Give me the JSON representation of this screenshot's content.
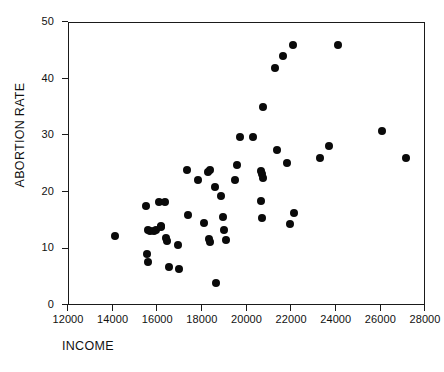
{
  "chart_data": {
    "type": "scatter",
    "title": "",
    "xlabel": "INCOME",
    "ylabel": "ABORTION RATE",
    "xlim": [
      12000,
      28000
    ],
    "ylim": [
      0,
      50
    ],
    "xticks": [
      12000,
      14000,
      16000,
      18000,
      20000,
      22000,
      24000,
      26000,
      28000
    ],
    "yticks": [
      0,
      10,
      20,
      30,
      40,
      50
    ],
    "xtick_labels": [
      "12000",
      "14000",
      "16000",
      "18000",
      "20000",
      "22000",
      "24000",
      "26000",
      "28000"
    ],
    "ytick_labels": [
      "0",
      "10",
      "20",
      "30",
      "40",
      "50"
    ],
    "grid": false,
    "legend": false,
    "marker": "filled-circle",
    "marker_color": "#0a0a0a",
    "marker_size": 8,
    "n_points": 52,
    "points": [
      {
        "x": 14050,
        "y": 12.3
      },
      {
        "x": 15450,
        "y": 17.6
      },
      {
        "x": 15480,
        "y": 9.2
      },
      {
        "x": 15530,
        "y": 7.7
      },
      {
        "x": 15560,
        "y": 13.5
      },
      {
        "x": 15640,
        "y": 13.3
      },
      {
        "x": 15820,
        "y": 13.3
      },
      {
        "x": 15900,
        "y": 13.5
      },
      {
        "x": 16030,
        "y": 18.3
      },
      {
        "x": 16120,
        "y": 14.2
      },
      {
        "x": 16140,
        "y": 13.9
      },
      {
        "x": 16290,
        "y": 18.3
      },
      {
        "x": 16330,
        "y": 12.1
      },
      {
        "x": 16390,
        "y": 11.4
      },
      {
        "x": 16480,
        "y": 6.9
      },
      {
        "x": 16880,
        "y": 10.7
      },
      {
        "x": 16930,
        "y": 6.6
      },
      {
        "x": 17290,
        "y": 24.1
      },
      {
        "x": 17330,
        "y": 16.1
      },
      {
        "x": 17760,
        "y": 22.2
      },
      {
        "x": 18030,
        "y": 14.7
      },
      {
        "x": 18250,
        "y": 23.6
      },
      {
        "x": 18340,
        "y": 24.0
      },
      {
        "x": 18260,
        "y": 11.8
      },
      {
        "x": 18300,
        "y": 11.3
      },
      {
        "x": 18530,
        "y": 21.1
      },
      {
        "x": 18600,
        "y": 4.0
      },
      {
        "x": 18800,
        "y": 19.5
      },
      {
        "x": 18900,
        "y": 15.7
      },
      {
        "x": 18950,
        "y": 13.4
      },
      {
        "x": 19020,
        "y": 11.6
      },
      {
        "x": 19430,
        "y": 22.2
      },
      {
        "x": 19540,
        "y": 25.0
      },
      {
        "x": 19650,
        "y": 29.9
      },
      {
        "x": 20250,
        "y": 29.9
      },
      {
        "x": 20600,
        "y": 23.9
      },
      {
        "x": 20650,
        "y": 23.4
      },
      {
        "x": 20700,
        "y": 22.7
      },
      {
        "x": 20600,
        "y": 18.5
      },
      {
        "x": 20630,
        "y": 15.5
      },
      {
        "x": 20700,
        "y": 35.2
      },
      {
        "x": 21250,
        "y": 42.0
      },
      {
        "x": 21300,
        "y": 27.6
      },
      {
        "x": 21600,
        "y": 44.1
      },
      {
        "x": 21760,
        "y": 25.2
      },
      {
        "x": 21890,
        "y": 14.4
      },
      {
        "x": 22050,
        "y": 46.1
      },
      {
        "x": 22080,
        "y": 16.5
      },
      {
        "x": 23250,
        "y": 26.2
      },
      {
        "x": 23660,
        "y": 28.3
      },
      {
        "x": 24070,
        "y": 46.1
      },
      {
        "x": 26030,
        "y": 30.9
      },
      {
        "x": 27100,
        "y": 26.1
      }
    ]
  }
}
